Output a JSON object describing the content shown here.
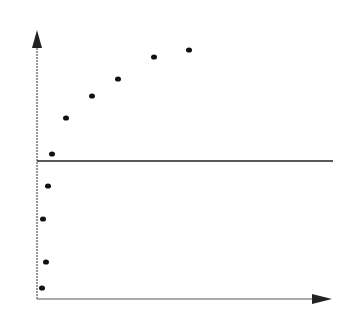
{
  "chart_data": {
    "type": "scatter",
    "title": "",
    "xlabel": "",
    "ylabel": "",
    "grid": false,
    "legend": null,
    "axes": {
      "origin_px": [
        37,
        299
      ],
      "y_axis_top_px": 30,
      "x_axis_right_px": 332,
      "arrowheads": true,
      "y_axis_style": "dashed"
    },
    "reference_line": {
      "orientation": "horizontal",
      "y_px": 161,
      "x_start_px": 37,
      "x_end_px": 333
    },
    "points_px": [
      {
        "x": 42,
        "y": 288
      },
      {
        "x": 46,
        "y": 262
      },
      {
        "x": 43,
        "y": 219
      },
      {
        "x": 48,
        "y": 186
      },
      {
        "x": 52,
        "y": 154
      },
      {
        "x": 66,
        "y": 118
      },
      {
        "x": 92,
        "y": 96
      },
      {
        "x": 118,
        "y": 79
      },
      {
        "x": 154,
        "y": 57
      },
      {
        "x": 189,
        "y": 50
      }
    ],
    "colors": {
      "axis": "#222222",
      "point": "#111111",
      "reference_line": "#222222",
      "background": "#ffffff"
    }
  }
}
